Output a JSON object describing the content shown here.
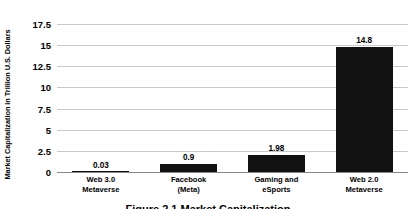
{
  "chart_data": {
    "type": "bar",
    "title": "",
    "xlabel": "",
    "ylabel": "Market Capitalization in Trillion U.S. Dollars",
    "categories": [
      "Web 3.0\nMetaverse",
      "Facebook\n(Meta)",
      "Gaming and\neSports",
      "Web 2.0\nMetaverse"
    ],
    "category_lines": [
      [
        "Web 3.0",
        "Metaverse"
      ],
      [
        "Facebook",
        "(Meta)"
      ],
      [
        "Gaming and",
        "eSports"
      ],
      [
        "Web 2.0",
        "Metaverse"
      ]
    ],
    "values": [
      0.03,
      0.9,
      1.98,
      14.8
    ],
    "value_labels": [
      "0.03",
      "0.9",
      "1.98",
      "14.8"
    ],
    "ylim": [
      0,
      17.5
    ],
    "yticks": [
      0,
      2.5,
      5,
      7.5,
      10,
      12.5,
      15,
      17.5
    ],
    "ytick_labels": [
      "0",
      "2.5",
      "5",
      "7.5",
      "10",
      "12.5",
      "15",
      "17.5"
    ],
    "grid": true,
    "legend": null,
    "bar_color": "#111111",
    "grid_color": "#c9c9c9",
    "axis_color": "#8a8a8a",
    "background": "#ffffff"
  },
  "caption": {
    "text": "Figure 2.1  Market Capitalization"
  }
}
